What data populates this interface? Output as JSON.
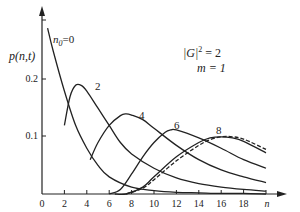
{
  "chart_data": {
    "type": "line",
    "title": "",
    "xlabel": "n",
    "ylabel": "p(n,t)",
    "xlim": [
      0,
      20
    ],
    "ylim": [
      0,
      0.3
    ],
    "grid": false,
    "x_ticks": [
      "0",
      "2",
      "4",
      "6",
      "8",
      "10",
      "12",
      "14",
      "16",
      "18"
    ],
    "y_ticks": [
      "0.1",
      "0.2"
    ],
    "annotations": {
      "params_line1": "|G|² = 2",
      "params_line2": "m = 1"
    },
    "series": [
      {
        "name": "n0=0",
        "label": "n₀=0",
        "x": [
          0.5,
          1,
          2,
          3,
          4,
          5,
          6,
          8,
          10,
          12,
          14,
          16,
          18,
          20
        ],
        "values": [
          0.29,
          0.25,
          0.18,
          0.12,
          0.08,
          0.05,
          0.03,
          0.012,
          0.006,
          0.003,
          0.002,
          0.001,
          0.001,
          0.0
        ]
      },
      {
        "name": "2",
        "label": "2",
        "x": [
          2,
          2.5,
          3,
          3.5,
          4,
          5,
          6,
          7,
          8,
          10,
          12,
          14,
          16,
          18,
          20
        ],
        "values": [
          0.12,
          0.17,
          0.19,
          0.19,
          0.18,
          0.15,
          0.12,
          0.09,
          0.07,
          0.045,
          0.028,
          0.018,
          0.012,
          0.008,
          0.005
        ]
      },
      {
        "name": "4",
        "label": "4",
        "x": [
          4.3,
          5,
          6,
          7,
          7.5,
          8,
          9,
          10,
          12,
          14,
          16,
          18,
          20
        ],
        "values": [
          0.06,
          0.09,
          0.12,
          0.137,
          0.14,
          0.138,
          0.13,
          0.115,
          0.085,
          0.06,
          0.042,
          0.03,
          0.02
        ]
      },
      {
        "name": "6",
        "label": "6",
        "x": [
          6,
          7,
          8,
          9,
          10,
          11,
          11.5,
          12,
          14,
          16,
          18,
          20
        ],
        "values": [
          0.0,
          0.008,
          0.035,
          0.065,
          0.09,
          0.108,
          0.112,
          0.112,
          0.098,
          0.08,
          0.06,
          0.045
        ]
      },
      {
        "name": "8",
        "label": "8",
        "x": [
          6.5,
          7.5,
          9,
          10,
          12,
          14,
          15,
          16,
          17,
          18,
          20
        ],
        "values": [
          0.0,
          0.0,
          0.012,
          0.03,
          0.065,
          0.09,
          0.098,
          0.1,
          0.098,
          0.092,
          0.072
        ]
      },
      {
        "name": "8 (dashed)",
        "label": "",
        "style": "dashed",
        "x": [
          7.5,
          9,
          10,
          12,
          14,
          15,
          16,
          17,
          18,
          20
        ],
        "values": [
          0.0,
          0.01,
          0.025,
          0.058,
          0.085,
          0.095,
          0.1,
          0.1,
          0.096,
          0.078
        ]
      }
    ]
  },
  "labels": {
    "y_axis": "p(n,t)",
    "x_axis": "n",
    "n0_label": "n",
    "n0_sub": "0",
    "n0_eq": "=0",
    "curve_2": "2",
    "curve_4": "4",
    "curve_6": "6",
    "curve_8": "8",
    "param_g": "|G|",
    "param_g_sup": "2",
    "param_g_val": " = 2",
    "param_m": "m = 1",
    "y_tick_02": "0.2",
    "y_tick_01": "0.1",
    "x_ticks": [
      "0",
      "2",
      "4",
      "6",
      "8",
      "10",
      "12",
      "14",
      "16",
      "18"
    ]
  }
}
